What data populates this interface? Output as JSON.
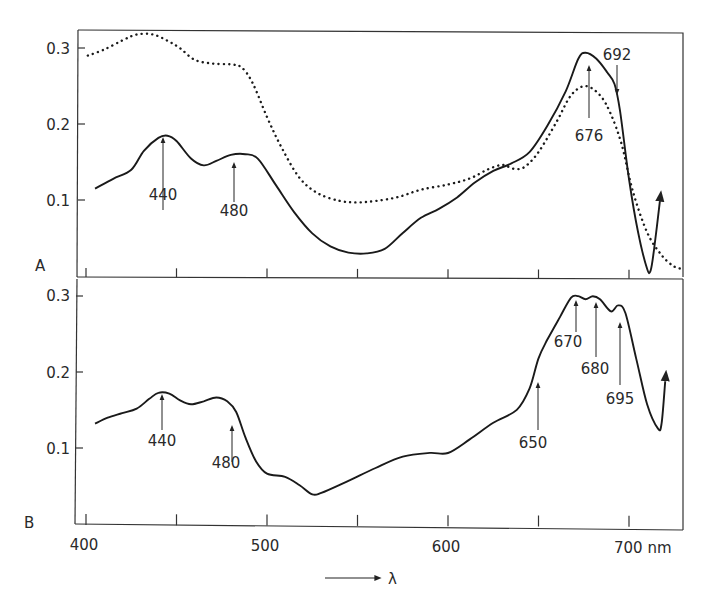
{
  "chart_data": [
    {
      "panel": "A",
      "type": "line",
      "panel_label": "A",
      "xlabel": "λ",
      "x_unit": "nm",
      "xlim": [
        388,
        731
      ],
      "ylim": [
        0,
        0.325
      ],
      "yticks": [
        0.1,
        0.2,
        0.3
      ],
      "ytick_labels": [
        "0.1",
        "0.2",
        "0.3"
      ],
      "xticks": [
        400,
        450,
        500,
        550,
        600,
        650,
        700
      ],
      "grid": false,
      "series": [
        {
          "name": "solid",
          "style": "solid",
          "points": [
            [
              405,
              0.115
            ],
            [
              415,
              0.128
            ],
            [
              425,
              0.14
            ],
            [
              432,
              0.165
            ],
            [
              440,
              0.182
            ],
            [
              445,
              0.185
            ],
            [
              450,
              0.178
            ],
            [
              458,
              0.155
            ],
            [
              465,
              0.146
            ],
            [
              472,
              0.152
            ],
            [
              480,
              0.16
            ],
            [
              488,
              0.161
            ],
            [
              495,
              0.155
            ],
            [
              505,
              0.12
            ],
            [
              515,
              0.085
            ],
            [
              525,
              0.057
            ],
            [
              535,
              0.04
            ],
            [
              545,
              0.032
            ],
            [
              555,
              0.031
            ],
            [
              565,
              0.037
            ],
            [
              575,
              0.058
            ],
            [
              585,
              0.078
            ],
            [
              595,
              0.09
            ],
            [
              605,
              0.105
            ],
            [
              615,
              0.125
            ],
            [
              625,
              0.14
            ],
            [
              635,
              0.15
            ],
            [
              645,
              0.165
            ],
            [
              655,
              0.2
            ],
            [
              665,
              0.245
            ],
            [
              672,
              0.288
            ],
            [
              676,
              0.296
            ],
            [
              682,
              0.288
            ],
            [
              688,
              0.27
            ],
            [
              692,
              0.255
            ],
            [
              695,
              0.22
            ],
            [
              700,
              0.13
            ],
            [
              705,
              0.06
            ],
            [
              710,
              0.012
            ],
            [
              712,
              0.01
            ],
            [
              714,
              0.04
            ],
            [
              717,
              0.1
            ]
          ]
        },
        {
          "name": "dotted",
          "style": "dotted",
          "points": [
            [
              401,
              0.29
            ],
            [
              410,
              0.298
            ],
            [
              420,
              0.31
            ],
            [
              428,
              0.318
            ],
            [
              437,
              0.318
            ],
            [
              445,
              0.31
            ],
            [
              452,
              0.3
            ],
            [
              460,
              0.285
            ],
            [
              470,
              0.28
            ],
            [
              480,
              0.279
            ],
            [
              486,
              0.275
            ],
            [
              492,
              0.255
            ],
            [
              500,
              0.21
            ],
            [
              508,
              0.17
            ],
            [
              518,
              0.13
            ],
            [
              528,
              0.11
            ],
            [
              540,
              0.1
            ],
            [
              550,
              0.098
            ],
            [
              560,
              0.1
            ],
            [
              572,
              0.105
            ],
            [
              585,
              0.115
            ],
            [
              600,
              0.122
            ],
            [
              612,
              0.13
            ],
            [
              622,
              0.142
            ],
            [
              630,
              0.148
            ],
            [
              636,
              0.143
            ],
            [
              642,
              0.145
            ],
            [
              650,
              0.165
            ],
            [
              660,
              0.205
            ],
            [
              668,
              0.24
            ],
            [
              676,
              0.252
            ],
            [
              684,
              0.24
            ],
            [
              690,
              0.215
            ],
            [
              696,
              0.175
            ],
            [
              702,
              0.115
            ],
            [
              710,
              0.06
            ],
            [
              718,
              0.03
            ],
            [
              725,
              0.015
            ],
            [
              730,
              0.012
            ]
          ]
        }
      ],
      "annotations": [
        {
          "label": "440",
          "x": 440,
          "direction": "up"
        },
        {
          "label": "480",
          "x": 480,
          "direction": "up"
        },
        {
          "label": "676",
          "x": 676,
          "direction": "up"
        },
        {
          "label": "692",
          "x": 692,
          "direction": "down"
        }
      ]
    },
    {
      "panel": "B",
      "type": "line",
      "panel_label": "B",
      "xlabel": "λ",
      "x_unit": "nm",
      "xlim": [
        388,
        731
      ],
      "ylim": [
        0,
        0.325
      ],
      "yticks": [
        0.1,
        0.2,
        0.3
      ],
      "ytick_labels": [
        "0.1",
        "0.2",
        "0.3"
      ],
      "xticks": [
        400,
        450,
        500,
        550,
        600,
        650,
        700
      ],
      "xtick_labels": [
        "400",
        "500",
        "600",
        "700 nm"
      ],
      "grid": false,
      "series": [
        {
          "name": "solid",
          "style": "solid",
          "points": [
            [
              405,
              0.132
            ],
            [
              412,
              0.14
            ],
            [
              420,
              0.146
            ],
            [
              428,
              0.152
            ],
            [
              435,
              0.165
            ],
            [
              440,
              0.173
            ],
            [
              446,
              0.172
            ],
            [
              452,
              0.163
            ],
            [
              458,
              0.158
            ],
            [
              465,
              0.162
            ],
            [
              472,
              0.167
            ],
            [
              478,
              0.162
            ],
            [
              483,
              0.148
            ],
            [
              488,
              0.115
            ],
            [
              494,
              0.083
            ],
            [
              500,
              0.067
            ],
            [
              510,
              0.063
            ],
            [
              518,
              0.052
            ],
            [
              525,
              0.04
            ],
            [
              530,
              0.042
            ],
            [
              545,
              0.058
            ],
            [
              560,
              0.075
            ],
            [
              575,
              0.09
            ],
            [
              590,
              0.095
            ],
            [
              600,
              0.095
            ],
            [
              612,
              0.113
            ],
            [
              625,
              0.135
            ],
            [
              638,
              0.152
            ],
            [
              645,
              0.18
            ],
            [
              650,
              0.22
            ],
            [
              655,
              0.245
            ],
            [
              662,
              0.275
            ],
            [
              668,
              0.3
            ],
            [
              672,
              0.302
            ],
            [
              676,
              0.298
            ],
            [
              680,
              0.302
            ],
            [
              684,
              0.298
            ],
            [
              690,
              0.282
            ],
            [
              694,
              0.29
            ],
            [
              698,
              0.28
            ],
            [
              704,
              0.22
            ],
            [
              710,
              0.16
            ],
            [
              716,
              0.128
            ],
            [
              718,
              0.135
            ],
            [
              720,
              0.19
            ]
          ]
        }
      ],
      "annotations": [
        {
          "label": "440",
          "x": 440,
          "direction": "up"
        },
        {
          "label": "480",
          "x": 480,
          "direction": "up"
        },
        {
          "label": "650",
          "x": 650,
          "direction": "up"
        },
        {
          "label": "670",
          "x": 670,
          "direction": "up"
        },
        {
          "label": "680",
          "x": 680,
          "direction": "up"
        },
        {
          "label": "695",
          "x": 695,
          "direction": "up"
        }
      ]
    }
  ],
  "axis": {
    "x_tick_labels": [
      "400",
      "500",
      "600",
      "700 nm"
    ],
    "x_label": "λ",
    "y_tick_labels_a": [
      "0.3",
      "0.2",
      "0.1"
    ],
    "y_tick_labels_b": [
      "0.3",
      "0.2",
      "0.1"
    ],
    "panel_a_label": "A",
    "panel_b_label": "B"
  },
  "annotations_a": [
    "440",
    "480",
    "676",
    "692"
  ],
  "annotations_b": [
    "440",
    "480",
    "650",
    "670",
    "680",
    "695"
  ]
}
